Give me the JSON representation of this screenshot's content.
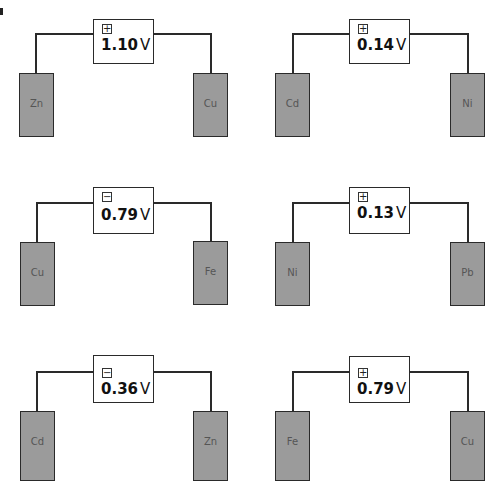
{
  "figure_label": "a",
  "colors": {
    "electrode_fill": "#9b9b9b",
    "line": "#2a2a2a",
    "background": "#ffffff"
  },
  "cells": [
    {
      "sign": "+",
      "voltage": "1.10",
      "unit": "V",
      "left_electrode": "Zn",
      "right_electrode": "Cu"
    },
    {
      "sign": "+",
      "voltage": "0.14",
      "unit": "V",
      "left_electrode": "Cd",
      "right_electrode": "Ni"
    },
    {
      "sign": "−",
      "voltage": "0.79",
      "unit": "V",
      "left_electrode": "Cu",
      "right_electrode": "Fe"
    },
    {
      "sign": "+",
      "voltage": "0.13",
      "unit": "V",
      "left_electrode": "Ni",
      "right_electrode": "Pb"
    },
    {
      "sign": "−",
      "voltage": "0.36",
      "unit": "V",
      "left_electrode": "Cd",
      "right_electrode": "Zn"
    },
    {
      "sign": "+",
      "voltage": "0.79",
      "unit": "V",
      "left_electrode": "Fe",
      "right_electrode": "Cu"
    }
  ]
}
